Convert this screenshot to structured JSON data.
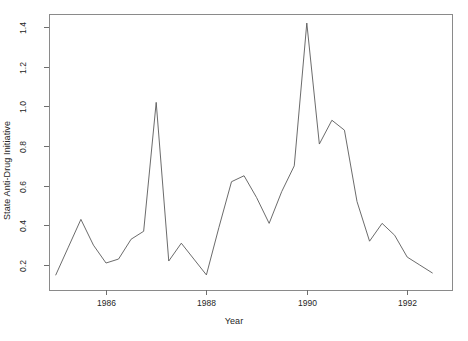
{
  "chart_data": {
    "type": "line",
    "title": "",
    "xlabel": "Year",
    "ylabel": "State Anti-Drug Initiative",
    "xlim": [
      1984.95,
      1992.75
    ],
    "ylim": [
      0.13,
      1.45
    ],
    "grid": false,
    "legend": null,
    "xticks": [
      1986,
      1988,
      1990,
      1992
    ],
    "xtick_labels": [
      "1986",
      "1988",
      "1990",
      "1992"
    ],
    "yticks": [
      0.2,
      0.4,
      0.6,
      0.8,
      1.0,
      1.2,
      1.4
    ],
    "ytick_labels": [
      "0.2",
      "0.4",
      "0.6",
      "0.8",
      "1.0",
      "1.2",
      "1.4"
    ],
    "series": [
      {
        "name": "State Anti-Drug Initiative",
        "color": "#5a5a5a",
        "x": [
          1985.0,
          1985.25,
          1985.5,
          1985.75,
          1986.0,
          1986.25,
          1986.5,
          1986.75,
          1987.0,
          1987.25,
          1987.5,
          1987.75,
          1988.0,
          1988.25,
          1988.5,
          1988.75,
          1989.0,
          1989.25,
          1989.5,
          1989.75,
          1990.0,
          1990.25,
          1990.5,
          1990.75,
          1991.0,
          1991.25,
          1991.5,
          1991.75,
          1992.0,
          1992.25,
          1992.5
        ],
        "y": [
          0.15,
          0.29,
          0.43,
          0.3,
          0.21,
          0.23,
          0.33,
          0.37,
          1.02,
          0.22,
          0.31,
          0.23,
          0.15,
          0.39,
          0.62,
          0.65,
          0.54,
          0.41,
          0.57,
          0.7,
          1.42,
          0.81,
          0.93,
          0.88,
          0.52,
          0.32,
          0.41,
          0.35,
          0.24,
          0.2,
          0.16
        ]
      }
    ]
  },
  "plot_geometry": {
    "frame": {
      "left": 49,
      "top": 14,
      "right": 452,
      "bottom": 290
    },
    "x_axis_px": {
      "year_1986": 106,
      "px_per_year": 50.2
    },
    "y_axis_px": {
      "value_0_2": 265,
      "px_per_unit": 198.3
    }
  }
}
